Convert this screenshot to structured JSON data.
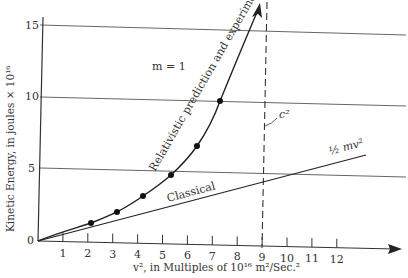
{
  "chart_data": {
    "type": "line",
    "title": "",
    "xlabel": "v², in Multiples of 10¹⁶ m²/Sec.²",
    "ylabel": "Kinetic Energy, in joules × 10¹⁶",
    "xlim": [
      0,
      13
    ],
    "ylim": [
      0,
      16
    ],
    "x_ticks": [
      "1",
      "2",
      "3",
      "4",
      "5",
      "6",
      "7",
      "8",
      "9",
      "10",
      "11",
      "12"
    ],
    "y_ticks": [
      "0",
      "5",
      "10",
      "15"
    ],
    "grid": "horizontal lines at 5, 10, 15",
    "annotations": {
      "mass": "m = 1",
      "c_squared": "c²",
      "classical_formula": "½ mv²",
      "relativistic_label": "Relativistic prediction and experiment",
      "classical_label": "Classical"
    },
    "series": [
      {
        "name": "Relativistic prediction and experiment",
        "style": "curve with data points, asymptotic to v² = c² (9)",
        "points": [
          {
            "x": 2.1,
            "y": 1.3
          },
          {
            "x": 3.2,
            "y": 2.0
          },
          {
            "x": 4.2,
            "y": 3.2
          },
          {
            "x": 5.3,
            "y": 4.6
          },
          {
            "x": 6.4,
            "y": 6.7
          },
          {
            "x": 7.3,
            "y": 9.8
          }
        ]
      },
      {
        "name": "Classical",
        "formula": "½ mv²",
        "style": "straight line",
        "x": [
          0,
          13
        ],
        "y": [
          0,
          6.5
        ]
      },
      {
        "name": "c²",
        "style": "dashed vertical asymptote",
        "x": 9
      }
    ]
  }
}
